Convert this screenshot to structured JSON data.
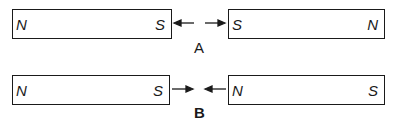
{
  "diagrams": [
    {
      "label": "A",
      "description": "Like poles (S-S) facing: repulsion",
      "left_magnet": {
        "left_pole": "N",
        "right_pole": "S"
      },
      "right_magnet": {
        "left_pole": "S",
        "right_pole": "N"
      },
      "arrows": "outward"
    },
    {
      "label": "B",
      "description": "Unlike poles (S-N) facing: attraction",
      "left_magnet": {
        "left_pole": "N",
        "right_pole": "S"
      },
      "right_magnet": {
        "left_pole": "N",
        "right_pole": "S"
      },
      "arrows": "inward"
    }
  ],
  "colors": {
    "ink": "#1a1a1a",
    "background": "#ffffff"
  }
}
